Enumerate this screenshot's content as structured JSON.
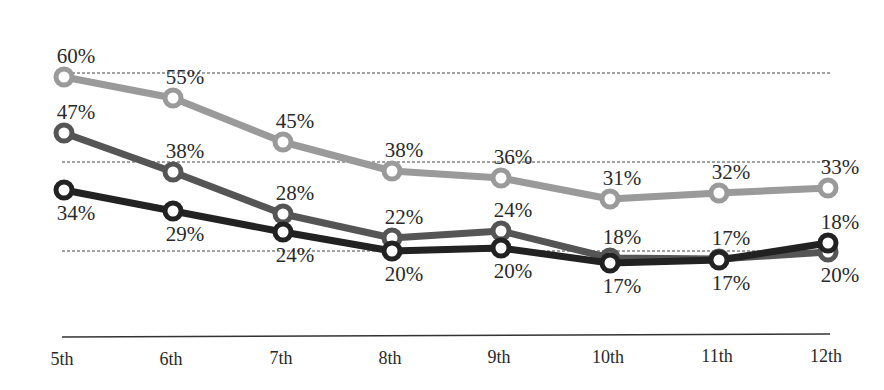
{
  "chart_data": {
    "type": "line",
    "title": "",
    "xlabel": "",
    "ylabel": "",
    "categories": [
      "5th",
      "6th",
      "7th",
      "8th",
      "9th",
      "10th",
      "11th",
      "12th"
    ],
    "series": [
      {
        "name": "Series 1 (light gray)",
        "color": "#9a9a9a",
        "values": [
          60,
          55,
          45,
          38,
          36,
          31,
          32,
          33
        ],
        "labels": [
          "60%",
          "55%",
          "45%",
          "38%",
          "36%",
          "31%",
          "32%",
          "33%"
        ],
        "y_px": [
          77,
          98,
          142,
          171,
          178,
          199,
          193,
          188
        ],
        "label_pos": [
          "above",
          "above",
          "above",
          "above",
          "above",
          "above",
          "above",
          "above"
        ]
      },
      {
        "name": "Series 2 (medium gray)",
        "color": "#555555",
        "values": [
          47,
          38,
          28,
          22,
          24,
          18,
          17,
          20
        ],
        "labels": [
          "47%",
          "38%",
          "28%",
          "22%",
          "24%",
          "18%",
          "17%",
          "20%"
        ],
        "y_px": [
          133,
          172,
          214,
          238,
          231,
          258,
          259,
          252
        ],
        "label_pos": [
          "above",
          "above",
          "above",
          "above",
          "above",
          "above",
          "above",
          "below"
        ]
      },
      {
        "name": "Series 3 (black)",
        "color": "#222222",
        "values": [
          34,
          29,
          24,
          20,
          20,
          17,
          17,
          18
        ],
        "labels": [
          "34%",
          "29%",
          "24%",
          "20%",
          "20%",
          "17%",
          "17%",
          "18%"
        ],
        "y_px": [
          190,
          211,
          232,
          251,
          248,
          263,
          260,
          243
        ],
        "label_pos": [
          "below",
          "below",
          "below",
          "below",
          "below",
          "below",
          "below",
          "above"
        ]
      }
    ],
    "gridlines": {
      "style": "dashed",
      "y_px": [
        73,
        162,
        251
      ]
    },
    "grid": true,
    "legend": "none",
    "ylim": [
      0,
      70
    ],
    "x_px": [
      64,
      173,
      283,
      392,
      501,
      610,
      719,
      828
    ]
  }
}
